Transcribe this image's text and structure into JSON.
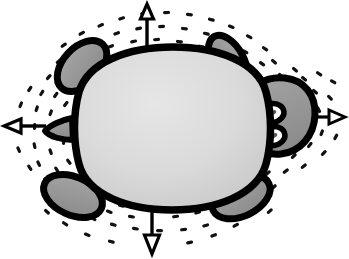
{
  "illustration": {
    "title": "Cartoon turtle viewed from above with four radiating motion arrows",
    "subject": "turtle",
    "view": "top-down",
    "style": "hand-drawn cartoon line art with halftone speckle aura",
    "canvas": {
      "width": 349,
      "height": 259,
      "background_color": "#ffffff"
    },
    "palette": {
      "outline": "#000000",
      "shell_fill_light": "#e3e3e3",
      "shell_fill_dark": "#c3c3c3",
      "limb_fill": "#9a9a9a",
      "head_fill": "#9a9a9a",
      "eye_white": "#ffffff",
      "pupil": "#4a4a4a",
      "speckle": "#000000",
      "arrow": "#000000"
    },
    "parts": [
      {
        "name": "shell",
        "label": "Turtle shell (carapace)",
        "shape": "rounded rectangle / squircle",
        "fill": "#d8d8d8",
        "outline_width_px": 7,
        "center": [
          173,
          128
        ],
        "width_px": 200,
        "height_px": 160
      },
      {
        "name": "head",
        "label": "Head",
        "shape": "rounded blob",
        "fill": "#9a9a9a",
        "center": [
          283,
          122
        ],
        "width_px": 66,
        "height_px": 62,
        "position": "right"
      },
      {
        "name": "front-left-flipper",
        "label": "Front left flipper",
        "fill": "#9a9a9a",
        "center": [
          80,
          65
        ],
        "angle_deg": -40,
        "position": "upper-left"
      },
      {
        "name": "front-right-flipper",
        "label": "Front right flipper",
        "fill": "#9a9a9a",
        "center": [
          227,
          62
        ],
        "angle_deg": 32,
        "position": "upper-right"
      },
      {
        "name": "rear-left-flipper",
        "label": "Rear left flipper",
        "fill": "#9a9a9a",
        "center": [
          72,
          196
        ],
        "angle_deg": 28,
        "position": "lower-left"
      },
      {
        "name": "rear-right-flipper",
        "label": "Rear right flipper",
        "fill": "#9a9a9a",
        "center": [
          240,
          196
        ],
        "angle_deg": -28,
        "position": "lower-right"
      },
      {
        "name": "tail",
        "label": "Tail nub",
        "fill": "#9a9a9a",
        "center": [
          58,
          130
        ],
        "position": "left"
      },
      {
        "name": "left-eye",
        "label": "Upper eye",
        "fill": "#ffffff",
        "center": [
          272,
          113
        ],
        "width_px": 22,
        "height_px": 17
      },
      {
        "name": "right-eye",
        "label": "Lower eye",
        "fill": "#ffffff",
        "center": [
          273,
          136
        ],
        "width_px": 22,
        "height_px": 17
      }
    ],
    "arrows": [
      {
        "name": "arrow-up",
        "direction": "up",
        "label": "Upward motion arrow",
        "from": [
          147,
          60
        ],
        "to": [
          147,
          6
        ],
        "head": "hollow triangle"
      },
      {
        "name": "arrow-down",
        "direction": "down",
        "label": "Downward motion arrow",
        "from": [
          152,
          204
        ],
        "to": [
          152,
          252
        ],
        "head": "hollow triangle"
      },
      {
        "name": "arrow-left",
        "direction": "left",
        "label": "Leftward motion arrow",
        "from": [
          43,
          126
        ],
        "to": [
          5,
          126
        ],
        "head": "hollow triangle"
      },
      {
        "name": "arrow-right",
        "direction": "right",
        "label": "Rightward motion arrow",
        "from": [
          313,
          117
        ],
        "to": [
          344,
          117
        ],
        "head": "hollow triangle"
      }
    ],
    "speckle_aura": {
      "name": "speckle-aura",
      "label": "Radiating dash speckles surrounding the turtle",
      "mark_shape": "short dash",
      "mark_count": 210,
      "color": "#000000",
      "orientation": "radial from body center"
    }
  }
}
